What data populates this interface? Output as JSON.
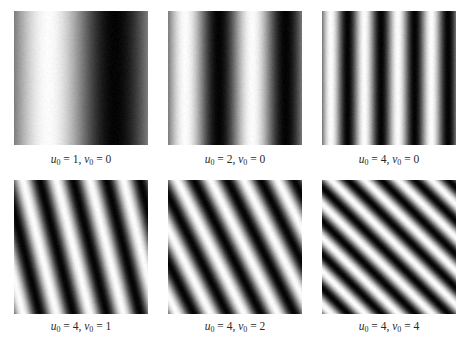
{
  "figure": {
    "panels": [
      {
        "u0": 1,
        "v0": 0,
        "u_label": "u",
        "v_label": "v",
        "sub": "0",
        "u_text": " = 1, ",
        "v_text": " = 0"
      },
      {
        "u0": 2,
        "v0": 0,
        "u_label": "u",
        "v_label": "v",
        "sub": "0",
        "u_text": " = 2, ",
        "v_text": " = 0"
      },
      {
        "u0": 4,
        "v0": 0,
        "u_label": "u",
        "v_label": "v",
        "sub": "0",
        "u_text": " = 4, ",
        "v_text": " = 0"
      },
      {
        "u0": 4,
        "v0": 1,
        "u_label": "u",
        "v_label": "v",
        "sub": "0",
        "u_text": " = 4, ",
        "v_text": " = 1"
      },
      {
        "u0": 4,
        "v0": 2,
        "u_label": "u",
        "v_label": "v",
        "sub": "0",
        "u_text": " = 4, ",
        "v_text": " = 2"
      },
      {
        "u0": 4,
        "v0": 4,
        "u_label": "u",
        "v_label": "v",
        "sub": "0",
        "u_text": " = 4, ",
        "v_text": " = 4"
      }
    ],
    "colors": {
      "background": "#ffffff",
      "stripe_light": "#ffffff",
      "stripe_dark": "#000000",
      "caption_text": "#2a2a2a"
    }
  }
}
